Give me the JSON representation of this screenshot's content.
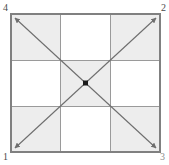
{
  "figure": {
    "square": {
      "left": 11,
      "top": 14,
      "right": 160,
      "bottom": 152,
      "border_color": "#808080",
      "border_width": 1.4
    },
    "grid": {
      "rows": 3,
      "cols": 3,
      "line_color": "#9a9a9a",
      "line_width": 1,
      "shaded_color": "#ededed",
      "unshaded_color": "#ffffff",
      "cells": [
        [
          {
            "name": "top-left",
            "shaded": true
          },
          {
            "name": "top-center",
            "shaded": false
          },
          {
            "name": "top-right",
            "shaded": true
          }
        ],
        [
          {
            "name": "middle-left",
            "shaded": false
          },
          {
            "name": "center",
            "shaded": true
          },
          {
            "name": "middle-right",
            "shaded": false
          }
        ],
        [
          {
            "name": "bottom-left",
            "shaded": true
          },
          {
            "name": "bottom-center",
            "shaded": false
          },
          {
            "name": "bottom-right",
            "shaded": true
          }
        ]
      ]
    },
    "diagonals": [
      {
        "name": "diagonal-tl-br",
        "from": "top-left-corner",
        "to": "bottom-right-corner",
        "double_headed": true,
        "color": "#6e6e6e"
      },
      {
        "name": "diagonal-bl-tr",
        "from": "bottom-left-corner",
        "to": "top-right-corner",
        "double_headed": true,
        "color": "#6e6e6e"
      }
    ],
    "center_marker": {
      "name": "center-point",
      "shape": "square",
      "size": 5,
      "color": "#1a1a1a"
    },
    "corner_labels": {
      "top_left": "4",
      "top_right": "2",
      "bottom_left": "1",
      "bottom_right": "3"
    }
  }
}
